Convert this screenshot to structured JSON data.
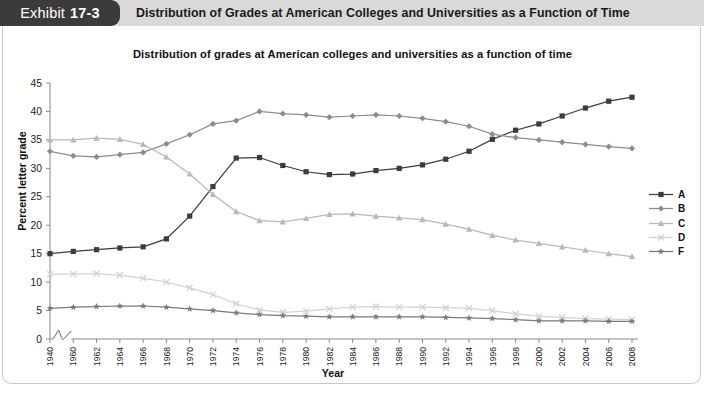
{
  "exhibit": {
    "label": "Exhibit",
    "number": "17-3",
    "title": "Distribution of Grades at American Colleges and Universities as a Function of Time"
  },
  "source": {
    "text": "Source: Stuart Rojstaczer, Grade Inflation at American Colleges and Universities"
  },
  "chart_data": {
    "type": "line",
    "title": "Distribution of grades at American colleges and universities as a function of time",
    "xlabel": "Year",
    "ylabel": "Percent letter grade",
    "ylim": [
      0,
      45
    ],
    "ytick_step": 5,
    "yticks": [
      "0",
      "5",
      "10",
      "15",
      "20",
      "25",
      "30",
      "35",
      "40",
      "45"
    ],
    "grid": false,
    "legend_position": "right",
    "axis_break_after_first_category": true,
    "categories": [
      "1940",
      "1960",
      "1962",
      "1964",
      "1966",
      "1968",
      "1970",
      "1972",
      "1974",
      "1976",
      "1978",
      "1980",
      "1982",
      "1984",
      "1986",
      "1988",
      "1990",
      "1992",
      "1994",
      "1996",
      "1998",
      "2000",
      "2002",
      "2004",
      "2006",
      "2008"
    ],
    "series": [
      {
        "name": "A",
        "marker": "square",
        "color": "#3c3c3c",
        "values": [
          15.0,
          15.4,
          15.7,
          16.0,
          16.2,
          17.6,
          21.6,
          26.8,
          31.8,
          31.9,
          30.5,
          29.4,
          28.9,
          29.0,
          29.6,
          30.0,
          30.6,
          31.6,
          33.0,
          35.1,
          36.7,
          37.8,
          39.2,
          40.6,
          41.8,
          42.5
        ]
      },
      {
        "name": "B",
        "marker": "diamond",
        "color": "#8c8c8c",
        "values": [
          33.0,
          32.2,
          32.0,
          32.4,
          32.8,
          34.3,
          35.9,
          37.8,
          38.4,
          40.0,
          39.6,
          39.4,
          39.0,
          39.2,
          39.4,
          39.2,
          38.8,
          38.2,
          37.4,
          36.0,
          35.4,
          35.0,
          34.6,
          34.2,
          33.8,
          33.5
        ]
      },
      {
        "name": "C",
        "marker": "triangle",
        "color": "#b8b8b8",
        "values": [
          35.0,
          35.0,
          35.3,
          35.1,
          34.2,
          32.0,
          29.0,
          25.4,
          22.4,
          20.8,
          20.6,
          21.2,
          21.9,
          22.0,
          21.6,
          21.3,
          21.0,
          20.2,
          19.3,
          18.2,
          17.4,
          16.8,
          16.2,
          15.6,
          15.0,
          14.5
        ]
      },
      {
        "name": "D",
        "marker": "cross",
        "color": "#d2d2d2",
        "values": [
          11.4,
          11.4,
          11.5,
          11.2,
          10.7,
          10.0,
          9.0,
          7.8,
          6.2,
          5.1,
          4.7,
          4.9,
          5.3,
          5.6,
          5.7,
          5.6,
          5.6,
          5.5,
          5.4,
          5.0,
          4.4,
          4.0,
          3.8,
          3.6,
          3.5,
          3.4
        ]
      },
      {
        "name": "F",
        "marker": "star",
        "color": "#7a7a7a",
        "values": [
          5.4,
          5.6,
          5.7,
          5.8,
          5.8,
          5.6,
          5.3,
          5.0,
          4.6,
          4.3,
          4.1,
          4.0,
          3.9,
          3.9,
          3.9,
          3.9,
          3.9,
          3.8,
          3.7,
          3.6,
          3.4,
          3.2,
          3.2,
          3.2,
          3.1,
          3.1
        ]
      }
    ]
  }
}
